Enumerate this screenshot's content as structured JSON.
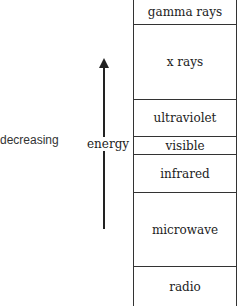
{
  "diagram": {
    "side_label": "decreasing",
    "arrow_label": "energy",
    "bands": [
      {
        "label": "gamma rays",
        "top": 0,
        "height": 25
      },
      {
        "label": "x rays",
        "top": 25,
        "height": 75
      },
      {
        "label": "ultraviolet",
        "top": 100,
        "height": 37
      },
      {
        "label": "visible",
        "top": 137,
        "height": 18
      },
      {
        "label": "infrared",
        "top": 155,
        "height": 38
      },
      {
        "label": "microwave",
        "top": 193,
        "height": 74
      },
      {
        "label": "radio",
        "top": 267,
        "height": 39
      }
    ]
  }
}
